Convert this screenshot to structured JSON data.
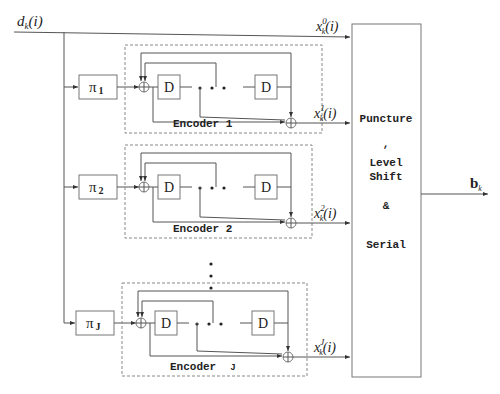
{
  "input": {
    "label_main": "d",
    "label_sub": "k",
    "label_arg": "(i)"
  },
  "systematic_output": {
    "label_main": "x",
    "label_sup": "0",
    "label_sub": "k",
    "label_arg": "(i)"
  },
  "encoders": [
    {
      "interleaver_symbol": "π",
      "interleaver_index": "1",
      "title": "Encoder  1",
      "delay_label": "D",
      "output_main": "x",
      "output_sup": "1",
      "output_sub": "k",
      "output_arg": "(i)"
    },
    {
      "interleaver_symbol": "π",
      "interleaver_index": "2",
      "title": "Encoder  2",
      "delay_label": "D",
      "output_main": "x",
      "output_sup": "2",
      "output_sub": "k",
      "output_arg": "(i)"
    },
    {
      "interleaver_symbol": "π",
      "interleaver_index": "J",
      "title": "Encoder",
      "title_index": "J",
      "delay_label": "D",
      "output_main": "x",
      "output_sup": "J",
      "output_sub": "k",
      "output_arg": "(i)"
    }
  ],
  "ellipsis_dots": "• • •",
  "processor": {
    "lines": [
      "Puncture",
      ",",
      "Level",
      "Shift",
      "&",
      "Serial"
    ]
  },
  "output": {
    "label_main": "b",
    "label_sub": "k"
  }
}
